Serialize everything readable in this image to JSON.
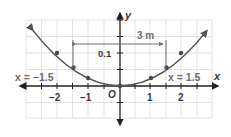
{
  "diagram": {
    "type": "parabola-graph",
    "axes": {
      "x_label": "x",
      "y_label": "y",
      "origin_label": "O"
    },
    "x_ticks": [
      "−2",
      "−1",
      "1",
      "2"
    ],
    "y_ticks": [
      "0.1"
    ],
    "annotations": {
      "left_line": "x = −1.5",
      "right_line": "x = 1.5",
      "width": "3 m"
    },
    "points": [
      {
        "x": -2,
        "y": 0.1
      },
      {
        "x": -1.5,
        "y": 0.05625
      },
      {
        "x": -1,
        "y": 0.025
      },
      {
        "x": 0,
        "y": 0
      },
      {
        "x": 1,
        "y": 0.025
      },
      {
        "x": 1.5,
        "y": 0.05625
      },
      {
        "x": 2,
        "y": 0.1
      }
    ],
    "colors": {
      "axis": "#222222",
      "curve": "#555555",
      "grid": "#d8d8d8",
      "annotation": "#707070"
    }
  }
}
